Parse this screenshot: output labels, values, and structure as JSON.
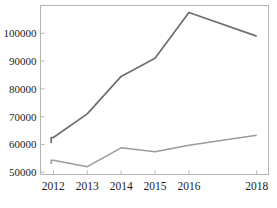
{
  "chart_data": {
    "type": "line",
    "title": "",
    "subtitle": "",
    "xlabel": "",
    "ylabel": "",
    "x": [
      2012,
      2013,
      2014,
      2015,
      2016,
      2018
    ],
    "categories": [
      "2012",
      "2013",
      "2014",
      "2015",
      "2016",
      "2018"
    ],
    "xtick_labels": [
      "2012",
      "2013",
      "2014",
      "2015",
      "2016",
      "2018"
    ],
    "ytick_labels": [
      "50000",
      "60000",
      "70000",
      "80000",
      "90000",
      "100000"
    ],
    "ytick_values": [
      50000,
      60000,
      70000,
      80000,
      90000,
      100000
    ],
    "ylim": [
      49200,
      110000
    ],
    "xlim": [
      2011.62,
      2018.35
    ],
    "grid": false,
    "legend": "none",
    "frame": true,
    "series": [
      {
        "name": "upper-series",
        "color": "#6e6e6e",
        "values": [
          62500,
          71000,
          84500,
          91000,
          107500,
          99000
        ],
        "leading_step_value": 60500
      },
      {
        "name": "lower-series",
        "color": "#9b9b9b",
        "values": [
          54300,
          52000,
          58800,
          57400,
          59700,
          63300
        ],
        "leading_step_value": 53000
      }
    ],
    "annotations": []
  },
  "axis": {
    "y_ticks": [
      {
        "label": "100000",
        "value": 100000
      },
      {
        "label": "90000",
        "value": 90000
      },
      {
        "label": "80000",
        "value": 80000
      },
      {
        "label": "70000",
        "value": 70000
      },
      {
        "label": "60000",
        "value": 60000
      },
      {
        "label": "50000",
        "value": 50000
      }
    ],
    "x_ticks": [
      {
        "label": "2012",
        "value": 2012
      },
      {
        "label": "2013",
        "value": 2013
      },
      {
        "label": "2014",
        "value": 2014
      },
      {
        "label": "2015",
        "value": 2015
      },
      {
        "label": "2016",
        "value": 2016
      },
      {
        "label": "2018",
        "value": 2018
      }
    ]
  },
  "caption": {
    "text": ""
  },
  "colors": {
    "frame": "#b4b4b4",
    "axis_text": "#1c1c1c",
    "upper_line": "#6e6e6e",
    "lower_line": "#9b9b9b",
    "background": "#ffffff"
  }
}
